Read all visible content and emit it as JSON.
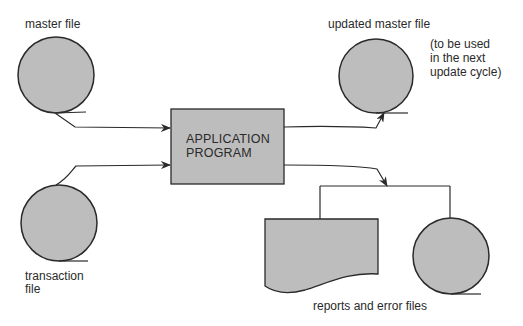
{
  "diagram": {
    "nodes": {
      "master_file": {
        "label": "master file",
        "shape": "tape-circle"
      },
      "transaction_file": {
        "label_line1": "transaction",
        "label_line2": "file",
        "shape": "tape-circle"
      },
      "application_program": {
        "label_line1": "APPLICATION",
        "label_line2": "PROGRAM",
        "shape": "rectangle"
      },
      "updated_master_file": {
        "label": "updated master file",
        "note_line1": "(to be used",
        "note_line2": "in the next",
        "note_line3": "update cycle)",
        "shape": "tape-circle"
      },
      "report_document": {
        "shape": "document"
      },
      "error_file": {
        "shape": "tape-circle"
      },
      "outputs_group": {
        "label": "reports and error files"
      }
    },
    "edges": [
      {
        "from": "master_file",
        "to": "application_program"
      },
      {
        "from": "transaction_file",
        "to": "application_program"
      },
      {
        "from": "application_program",
        "to": "updated_master_file"
      },
      {
        "from": "application_program",
        "to": "outputs_group"
      }
    ],
    "colors": {
      "fill": "#bdbdbd",
      "stroke": "#2a2a2a",
      "background": "#ffffff"
    }
  }
}
